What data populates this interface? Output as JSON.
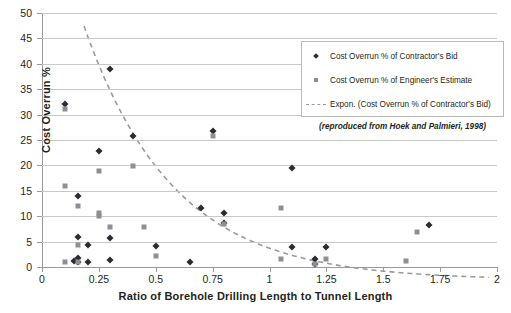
{
  "chart_data": {
    "type": "scatter",
    "title": "",
    "xlabel": "Ratio of Borehole Drilling Length to Tunnel Length",
    "ylabel": "Cost Overrun %",
    "xlim": [
      0,
      2
    ],
    "ylim": [
      0,
      50
    ],
    "xticks": [
      "0",
      "0.25",
      "0.5",
      "0.75",
      "1",
      "1.25",
      "1.5",
      "1.75",
      "2"
    ],
    "xtick_values": [
      0,
      0.25,
      0.5,
      0.75,
      1,
      1.25,
      1.5,
      1.75,
      2
    ],
    "yticks": [
      "0",
      "5",
      "10",
      "15",
      "20",
      "25",
      "30",
      "35",
      "40",
      "45",
      "50"
    ],
    "ytick_values": [
      0,
      5,
      10,
      15,
      20,
      25,
      30,
      35,
      40,
      45,
      50
    ],
    "grid": "horizontal",
    "legend_position": "top-right",
    "annotation": "(reproduced from Hoek and Palmieri, 1998)",
    "series": [
      {
        "name": "Cost Overrun % of Contractor's Bid",
        "marker": "diamond",
        "color": "#2b2b33",
        "points": [
          [
            0.1,
            32.0
          ],
          [
            0.14,
            1.2
          ],
          [
            0.16,
            14.0
          ],
          [
            0.16,
            5.9
          ],
          [
            0.16,
            1.8
          ],
          [
            0.16,
            1.0
          ],
          [
            0.2,
            4.4
          ],
          [
            0.2,
            0.9
          ],
          [
            0.25,
            22.9
          ],
          [
            0.3,
            38.9
          ],
          [
            0.3,
            5.8
          ],
          [
            0.3,
            1.4
          ],
          [
            0.4,
            25.8
          ],
          [
            0.5,
            4.2
          ],
          [
            0.65,
            0.9
          ],
          [
            0.7,
            11.7
          ],
          [
            0.75,
            26.7
          ],
          [
            0.8,
            10.7
          ],
          [
            0.8,
            8.6
          ],
          [
            1.1,
            19.5
          ],
          [
            1.1,
            4.0
          ],
          [
            1.2,
            1.5
          ],
          [
            1.2,
            0.6
          ],
          [
            1.25,
            3.9
          ],
          [
            1.7,
            8.3
          ]
        ]
      },
      {
        "name": "Cost Overrun % of Engineer's Estimate",
        "marker": "square",
        "color": "#8f8f93",
        "points": [
          [
            0.1,
            31.1
          ],
          [
            0.1,
            15.9
          ],
          [
            0.1,
            0.9
          ],
          [
            0.16,
            12.0
          ],
          [
            0.16,
            4.3
          ],
          [
            0.16,
            1.0
          ],
          [
            0.25,
            18.9
          ],
          [
            0.25,
            10.6
          ],
          [
            0.25,
            10.0
          ],
          [
            0.3,
            7.8
          ],
          [
            0.4,
            19.8
          ],
          [
            0.45,
            7.8
          ],
          [
            0.5,
            2.2
          ],
          [
            0.75,
            25.7
          ],
          [
            0.8,
            8.5
          ],
          [
            1.05,
            11.6
          ],
          [
            1.05,
            1.5
          ],
          [
            1.2,
            0.5
          ],
          [
            1.25,
            1.5
          ],
          [
            1.6,
            1.2
          ],
          [
            1.65,
            6.8
          ]
        ]
      }
    ],
    "trendline": {
      "name": "Expon. (Cost Overrun % of Contractor's Bid)",
      "type": "exponential",
      "style": "dashed",
      "color": "#9a9a9a",
      "y0": 50.0,
      "decay": 2.55,
      "x_start": 0,
      "x_end": 1.78
    }
  },
  "legend": {
    "items": [
      {
        "label": "Cost Overrun % of Contractor's Bid",
        "marker": "diamond"
      },
      {
        "label": "Cost Overrun % of Engineer's Estimate",
        "marker": "square"
      },
      {
        "label": "Expon. (Cost Overrun % of Contractor's Bid)",
        "marker": "dashed-line"
      }
    ]
  }
}
